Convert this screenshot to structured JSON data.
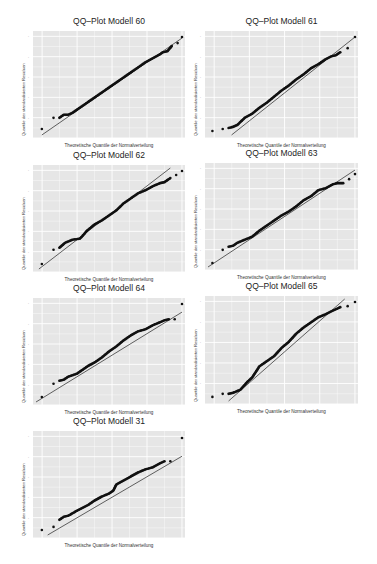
{
  "figure": {
    "background": "#ffffff",
    "panel_background": "#e6e6e6",
    "grid_color": "#ffffff",
    "point_color": "#111111",
    "line_color": "#222222"
  },
  "chart_data": [
    {
      "type": "scatter",
      "title": "QQ–Plot Modell 60",
      "xlabel": "Theoretische Quantile der Normalverteilung",
      "ylabel": "Quantile der standardisierten Residuen",
      "reference_line": true,
      "grid": true,
      "points_normalized": [
        [
          0.04,
          0.06
        ],
        [
          0.12,
          0.17
        ],
        [
          0.16,
          0.17
        ],
        [
          0.19,
          0.2
        ],
        [
          0.22,
          0.2
        ],
        [
          0.25,
          0.22
        ],
        [
          0.3,
          0.27
        ],
        [
          0.35,
          0.32
        ],
        [
          0.4,
          0.37
        ],
        [
          0.45,
          0.42
        ],
        [
          0.5,
          0.47
        ],
        [
          0.55,
          0.52
        ],
        [
          0.6,
          0.57
        ],
        [
          0.65,
          0.62
        ],
        [
          0.7,
          0.67
        ],
        [
          0.75,
          0.72
        ],
        [
          0.8,
          0.76
        ],
        [
          0.85,
          0.8
        ],
        [
          0.87,
          0.82
        ],
        [
          0.9,
          0.83
        ],
        [
          0.93,
          0.88
        ],
        [
          0.97,
          0.91
        ],
        [
          1.0,
          0.97
        ]
      ],
      "line": [
        [
          0.04,
          0.0
        ],
        [
          1.0,
          0.96
        ]
      ]
    },
    {
      "type": "scatter",
      "title": "QQ–Plot Modell 61",
      "xlabel": "Theoretische Quantile der Normalverteilung",
      "ylabel": "Quantile der standardisierten Residuen",
      "reference_line": true,
      "grid": true,
      "points_normalized": [
        [
          0.03,
          0.04
        ],
        [
          0.1,
          0.06
        ],
        [
          0.14,
          0.07
        ],
        [
          0.17,
          0.08
        ],
        [
          0.2,
          0.1
        ],
        [
          0.25,
          0.17
        ],
        [
          0.3,
          0.21
        ],
        [
          0.35,
          0.27
        ],
        [
          0.4,
          0.32
        ],
        [
          0.45,
          0.38
        ],
        [
          0.5,
          0.44
        ],
        [
          0.55,
          0.49
        ],
        [
          0.6,
          0.55
        ],
        [
          0.65,
          0.6
        ],
        [
          0.7,
          0.66
        ],
        [
          0.75,
          0.7
        ],
        [
          0.8,
          0.75
        ],
        [
          0.84,
          0.78
        ],
        [
          0.87,
          0.79
        ],
        [
          0.9,
          0.82
        ],
        [
          0.95,
          0.86
        ],
        [
          1.0,
          0.97
        ]
      ],
      "line": [
        [
          0.16,
          0.0
        ],
        [
          1.0,
          0.97
        ]
      ]
    },
    {
      "type": "scatter",
      "title": "QQ–Plot Modell 62",
      "xlabel": "Theoretische Quantile der Normalverteilung",
      "ylabel": "Quantile der standardisierten Residuen",
      "reference_line": true,
      "grid": true,
      "points_normalized": [
        [
          0.04,
          0.05
        ],
        [
          0.12,
          0.19
        ],
        [
          0.16,
          0.21
        ],
        [
          0.2,
          0.26
        ],
        [
          0.25,
          0.29
        ],
        [
          0.3,
          0.3
        ],
        [
          0.32,
          0.33
        ],
        [
          0.35,
          0.38
        ],
        [
          0.4,
          0.44
        ],
        [
          0.45,
          0.48
        ],
        [
          0.5,
          0.53
        ],
        [
          0.55,
          0.58
        ],
        [
          0.6,
          0.65
        ],
        [
          0.65,
          0.7
        ],
        [
          0.7,
          0.75
        ],
        [
          0.75,
          0.78
        ],
        [
          0.8,
          0.82
        ],
        [
          0.85,
          0.85
        ],
        [
          0.88,
          0.86
        ],
        [
          0.92,
          0.9
        ],
        [
          0.96,
          0.93
        ],
        [
          1.0,
          0.97
        ]
      ],
      "line": [
        [
          0.02,
          0.0
        ],
        [
          0.92,
          1.0
        ]
      ]
    },
    {
      "type": "scatter",
      "title": "QQ–Plot Modell 63",
      "xlabel": "Theoretische Quantile der Normalverteilung",
      "ylabel": "Quantile der standardisierten Residuen",
      "reference_line": true,
      "grid": true,
      "points_normalized": [
        [
          0.03,
          0.04
        ],
        [
          0.1,
          0.17
        ],
        [
          0.14,
          0.2
        ],
        [
          0.17,
          0.21
        ],
        [
          0.2,
          0.24
        ],
        [
          0.25,
          0.27
        ],
        [
          0.3,
          0.3
        ],
        [
          0.35,
          0.36
        ],
        [
          0.4,
          0.41
        ],
        [
          0.45,
          0.46
        ],
        [
          0.5,
          0.51
        ],
        [
          0.55,
          0.55
        ],
        [
          0.6,
          0.6
        ],
        [
          0.65,
          0.66
        ],
        [
          0.7,
          0.7
        ],
        [
          0.75,
          0.76
        ],
        [
          0.8,
          0.78
        ],
        [
          0.85,
          0.82
        ],
        [
          0.88,
          0.83
        ],
        [
          0.92,
          0.83
        ],
        [
          0.96,
          0.87
        ],
        [
          1.0,
          0.92
        ]
      ],
      "line": [
        [
          0.0,
          0.0
        ],
        [
          1.0,
          0.96
        ]
      ]
    },
    {
      "type": "scatter",
      "title": "QQ–Plot Modell 64",
      "xlabel": "Theoretische Quantile der Normalverteilung",
      "ylabel": "Quantile der standardisierten Residuen",
      "reference_line": true,
      "grid": true,
      "points_normalized": [
        [
          0.04,
          0.05
        ],
        [
          0.12,
          0.18
        ],
        [
          0.16,
          0.21
        ],
        [
          0.19,
          0.22
        ],
        [
          0.22,
          0.25
        ],
        [
          0.28,
          0.28
        ],
        [
          0.32,
          0.32
        ],
        [
          0.36,
          0.36
        ],
        [
          0.4,
          0.39
        ],
        [
          0.45,
          0.44
        ],
        [
          0.5,
          0.5
        ],
        [
          0.55,
          0.55
        ],
        [
          0.6,
          0.61
        ],
        [
          0.65,
          0.66
        ],
        [
          0.7,
          0.7
        ],
        [
          0.75,
          0.72
        ],
        [
          0.8,
          0.76
        ],
        [
          0.85,
          0.79
        ],
        [
          0.88,
          0.81
        ],
        [
          0.91,
          0.82
        ],
        [
          0.95,
          0.82
        ],
        [
          1.0,
          0.97
        ]
      ],
      "line": [
        [
          0.0,
          0.0
        ],
        [
          1.0,
          0.89
        ]
      ]
    },
    {
      "type": "scatter",
      "title": "QQ–Plot Modell 65",
      "xlabel": "Theoretische Quantile der Normalverteilung",
      "ylabel": "Quantile der standardisierten Residuen",
      "reference_line": true,
      "grid": true,
      "points_normalized": [
        [
          0.03,
          0.04
        ],
        [
          0.1,
          0.07
        ],
        [
          0.14,
          0.07
        ],
        [
          0.17,
          0.08
        ],
        [
          0.22,
          0.11
        ],
        [
          0.27,
          0.19
        ],
        [
          0.3,
          0.23
        ],
        [
          0.35,
          0.34
        ],
        [
          0.4,
          0.39
        ],
        [
          0.45,
          0.44
        ],
        [
          0.5,
          0.52
        ],
        [
          0.55,
          0.58
        ],
        [
          0.6,
          0.66
        ],
        [
          0.65,
          0.72
        ],
        [
          0.7,
          0.77
        ],
        [
          0.75,
          0.82
        ],
        [
          0.8,
          0.85
        ],
        [
          0.84,
          0.88
        ],
        [
          0.87,
          0.9
        ],
        [
          0.9,
          0.92
        ],
        [
          0.95,
          0.93
        ],
        [
          1.0,
          0.97
        ]
      ],
      "line": [
        [
          0.14,
          0.0
        ],
        [
          0.93,
          1.0
        ]
      ]
    },
    {
      "type": "scatter",
      "title": "QQ–Plot Modell 31",
      "xlabel": "Theoretische Quantile der Normalverteilung",
      "ylabel": "Quantile der standardisierten Residuen",
      "reference_line": true,
      "grid": true,
      "points_normalized": [
        [
          0.04,
          0.05
        ],
        [
          0.12,
          0.08
        ],
        [
          0.16,
          0.15
        ],
        [
          0.19,
          0.18
        ],
        [
          0.22,
          0.19
        ],
        [
          0.28,
          0.24
        ],
        [
          0.32,
          0.27
        ],
        [
          0.36,
          0.3
        ],
        [
          0.4,
          0.34
        ],
        [
          0.45,
          0.38
        ],
        [
          0.5,
          0.41
        ],
        [
          0.53,
          0.44
        ],
        [
          0.55,
          0.5
        ],
        [
          0.6,
          0.54
        ],
        [
          0.65,
          0.58
        ],
        [
          0.7,
          0.62
        ],
        [
          0.75,
          0.65
        ],
        [
          0.8,
          0.67
        ],
        [
          0.85,
          0.71
        ],
        [
          0.88,
          0.73
        ],
        [
          0.92,
          0.73
        ],
        [
          1.0,
          0.96
        ]
      ],
      "line": [
        [
          0.08,
          0.0
        ],
        [
          1.0,
          0.78
        ]
      ]
    }
  ]
}
